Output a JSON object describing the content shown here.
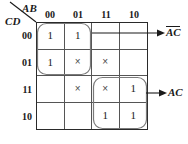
{
  "figure": {
    "type": "karnaugh-map",
    "variables_top": "AB",
    "variables_side": "CD",
    "column_headers": [
      "00",
      "01",
      "11",
      "10"
    ],
    "row_headers": [
      "00",
      "01",
      "11",
      "10"
    ],
    "ink_color": "#1a1a1a",
    "grid_line_color": "#555555",
    "loop_color": "#7a7a7a"
  },
  "cells": [
    {
      "row": "00",
      "col": "00",
      "value": "1"
    },
    {
      "row": "00",
      "col": "01",
      "value": "1"
    },
    {
      "row": "00",
      "col": "11",
      "value": ""
    },
    {
      "row": "00",
      "col": "10",
      "value": ""
    },
    {
      "row": "01",
      "col": "00",
      "value": "1"
    },
    {
      "row": "01",
      "col": "01",
      "value": "×"
    },
    {
      "row": "01",
      "col": "11",
      "value": "×"
    },
    {
      "row": "01",
      "col": "10",
      "value": ""
    },
    {
      "row": "11",
      "col": "00",
      "value": ""
    },
    {
      "row": "11",
      "col": "01",
      "value": "×"
    },
    {
      "row": "11",
      "col": "11",
      "value": "×"
    },
    {
      "row": "11",
      "col": "10",
      "value": "1"
    },
    {
      "row": "10",
      "col": "00",
      "value": ""
    },
    {
      "row": "10",
      "col": "01",
      "value": ""
    },
    {
      "row": "10",
      "col": "11",
      "value": "1"
    },
    {
      "row": "10",
      "col": "10",
      "value": "1"
    }
  ],
  "groups": [
    {
      "id": "group-not-a-not-c",
      "label_parts": [
        {
          "text": "A",
          "overbar": true
        },
        {
          "text": "C",
          "overbar": true
        }
      ],
      "label_plain": "ĀC̄"
    },
    {
      "id": "group-ac",
      "label_parts": [
        {
          "text": "AC",
          "overbar": false
        }
      ],
      "label_plain": "AC"
    }
  ]
}
